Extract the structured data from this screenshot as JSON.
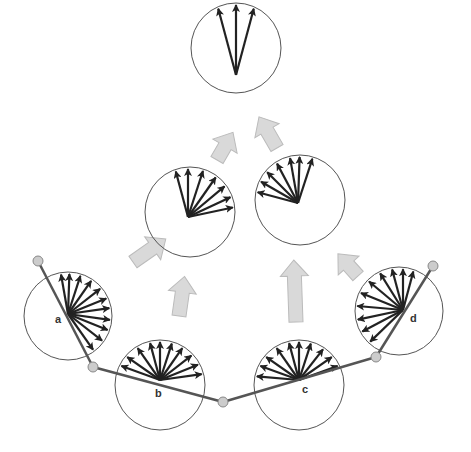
{
  "colors": {
    "background": "#ffffff",
    "circle_stroke": "#555555",
    "vector": "#222222",
    "segment": "#555555",
    "joint_fill": "#cccccc",
    "joint_stroke": "#888888",
    "flow_arrow_fill": "#d9d9d9",
    "flow_arrow_stroke": "#bbbbbb"
  },
  "segments": [
    {
      "from": [
        38,
        261
      ],
      "to": [
        93,
        367
      ]
    },
    {
      "from": [
        93,
        367
      ],
      "to": [
        223,
        402
      ]
    },
    {
      "from": [
        223,
        402
      ],
      "to": [
        376,
        357
      ]
    },
    {
      "from": [
        376,
        357
      ],
      "to": [
        433,
        266
      ]
    }
  ],
  "joints": [
    [
      38,
      261
    ],
    [
      93,
      367
    ],
    [
      223,
      402
    ],
    [
      376,
      357
    ],
    [
      433,
      266
    ]
  ],
  "circles": [
    {
      "id": "a",
      "label": "a",
      "cx": 68,
      "cy": 316,
      "r": 44,
      "ox": 68,
      "oy": 314,
      "label_pos": [
        55,
        323
      ],
      "angles": [
        -100,
        -88,
        -72,
        -55,
        -38,
        -22,
        -8,
        8,
        22,
        38,
        55
      ],
      "len": 44
    },
    {
      "id": "b",
      "label": "b",
      "cx": 160,
      "cy": 385,
      "r": 45,
      "ox": 160,
      "oy": 380,
      "label_pos": [
        155,
        397
      ],
      "angles": [
        -160,
        -145,
        -125,
        -105,
        -90,
        -72,
        -55,
        -38,
        -22,
        -8
      ],
      "len": 45
    },
    {
      "id": "c",
      "label": "c",
      "cx": 299,
      "cy": 385,
      "r": 45,
      "ox": 299,
      "oy": 380,
      "label_pos": [
        302,
        393
      ],
      "angles": [
        -175,
        -160,
        -145,
        -125,
        -105,
        -90,
        -72,
        -52,
        -35,
        -20
      ],
      "len": 45
    },
    {
      "id": "d",
      "label": "d",
      "cx": 399,
      "cy": 311,
      "r": 44,
      "ox": 403,
      "oy": 310,
      "label_pos": [
        410,
        322
      ],
      "angles": [
        -75,
        -90,
        -105,
        -122,
        -140,
        -158,
        -175,
        168,
        152,
        136
      ],
      "len": 44
    },
    {
      "id": "mid-left",
      "label": "",
      "cx": 190,
      "cy": 212,
      "r": 45,
      "ox": 188,
      "oy": 217,
      "angles": [
        -105,
        -90,
        -72,
        -55,
        -40,
        -25,
        -12
      ],
      "len": 42
    },
    {
      "id": "mid-right",
      "label": "",
      "cx": 300,
      "cy": 200,
      "r": 45,
      "ox": 298,
      "oy": 203,
      "angles": [
        -165,
        -150,
        -135,
        -118,
        -100,
        -88,
        -72
      ],
      "len": 42
    },
    {
      "id": "top",
      "label": "",
      "cx": 236,
      "cy": 48,
      "r": 45,
      "ox": 236,
      "oy": 75,
      "angles": [
        -105,
        -90,
        -75
      ],
      "len": 44
    }
  ],
  "flow_arrows": [
    {
      "x": 133,
      "y": 262,
      "angle": 55,
      "length": 40
    },
    {
      "x": 179,
      "y": 316,
      "angle": 8,
      "length": 40
    },
    {
      "x": 296,
      "y": 322,
      "angle": -2,
      "length": 62
    },
    {
      "x": 358,
      "y": 276,
      "angle": -42,
      "length": 30
    },
    {
      "x": 217,
      "y": 160,
      "angle": 30,
      "length": 32
    },
    {
      "x": 277,
      "y": 148,
      "angle": -30,
      "length": 36
    }
  ]
}
